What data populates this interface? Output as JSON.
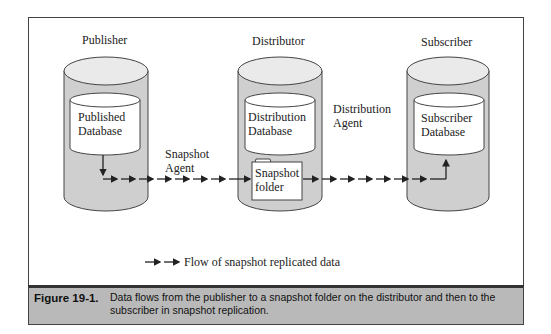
{
  "diagram": {
    "nodes": {
      "publisher": {
        "title": "Publisher",
        "inner_line1": "Published",
        "inner_line2": "Database"
      },
      "distributor": {
        "title": "Distributor",
        "inner_line1": "Distribution",
        "inner_line2": "Database",
        "folder_line1": "Snapshot",
        "folder_line2": "folder"
      },
      "subscriber": {
        "title": "Subscriber",
        "inner_line1": "Subscriber",
        "inner_line2": "Database"
      }
    },
    "agents": {
      "snapshot": {
        "line1": "Snapshot",
        "line2": "Agent"
      },
      "distribution": {
        "line1": "Distribution",
        "line2": "Agent"
      }
    },
    "legend": {
      "text": "Flow of snapshot replicated data"
    },
    "colors": {
      "cylinder_fill": "#cfcfcf",
      "caption_bar": "#b9b9b9",
      "stroke": "#333333"
    }
  },
  "caption": {
    "number": "Figure 19-1.",
    "text": "Data flows from the publisher to a snapshot folder on the distributor and then to the subscriber in snapshot replication."
  }
}
